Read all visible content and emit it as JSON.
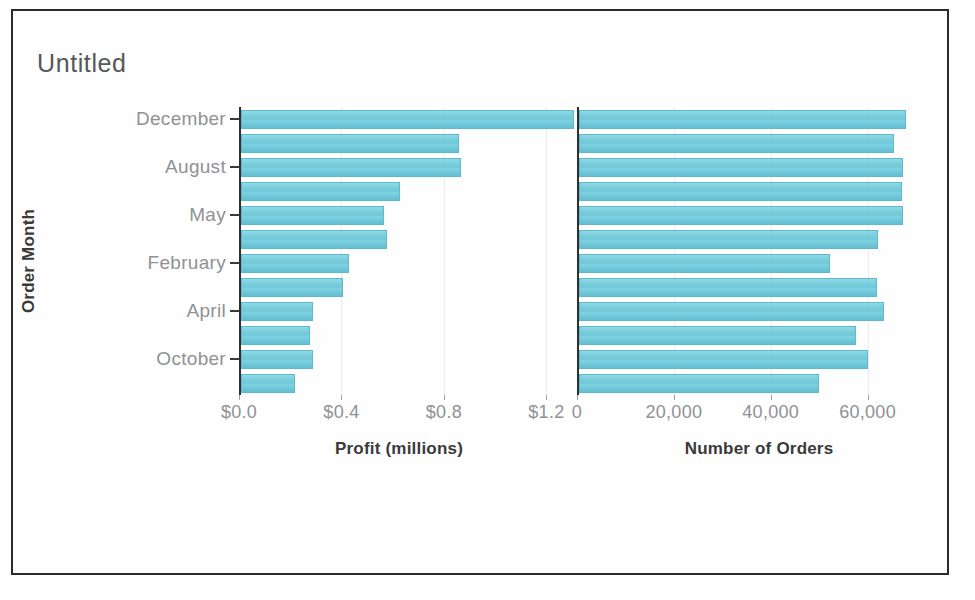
{
  "viz": {
    "title": "Untitled",
    "y_axis_title": "Order Month",
    "bar_color": "#77cfdd",
    "frame_color": "#2b2b2b",
    "axis_color": "#2f2f2f",
    "tick_label_color": "#8f9295"
  },
  "chart_data": [
    {
      "type": "bar",
      "orientation": "horizontal",
      "title": "Untitled",
      "panel": "left",
      "xlabel": "Profit (millions)",
      "ylabel": "Order Month",
      "categories": [
        "December",
        "November",
        "August",
        "July",
        "May",
        "June",
        "February",
        "March",
        "April",
        "September",
        "October",
        "January"
      ],
      "visible_tick_labels": [
        "December",
        "August",
        "May",
        "February",
        "April",
        "October"
      ],
      "values": [
        1.3,
        0.85,
        0.86,
        0.62,
        0.56,
        0.57,
        0.42,
        0.4,
        0.28,
        0.27,
        0.28,
        0.21
      ],
      "xlim": [
        0,
        1.3
      ],
      "xticks": [
        0.0,
        0.4,
        0.8,
        1.2
      ],
      "xticklabels": [
        "$0.0",
        "$0.4",
        "$0.8",
        "$1.2"
      ],
      "grid": true,
      "legend": "none"
    },
    {
      "type": "bar",
      "orientation": "horizontal",
      "panel": "right",
      "xlabel": "Number of Orders",
      "ylabel": "Order Month",
      "categories": [
        "December",
        "November",
        "August",
        "July",
        "May",
        "June",
        "February",
        "March",
        "April",
        "September",
        "October",
        "January"
      ],
      "visible_tick_labels": [
        "December",
        "August",
        "May",
        "February",
        "April",
        "October"
      ],
      "values": [
        67500,
        65000,
        66800,
        66600,
        66900,
        61800,
        51800,
        61500,
        63000,
        57300,
        59600,
        49500
      ],
      "xlim": [
        0,
        70000
      ],
      "xticks": [
        0,
        20000,
        40000,
        60000
      ],
      "xticklabels": [
        "0",
        "20,000",
        "40,000",
        "60,000"
      ],
      "grid": true,
      "legend": "none"
    }
  ],
  "layout": {
    "left_panel": {
      "axis_x": 226,
      "px_per_unit": 256,
      "top": 96,
      "row_height": 24,
      "bar_height": 19
    },
    "right_panel": {
      "axis_x": 564,
      "px_per_unit": 0.00405,
      "top": 96,
      "row_height": 24,
      "bar_height": 19
    }
  }
}
